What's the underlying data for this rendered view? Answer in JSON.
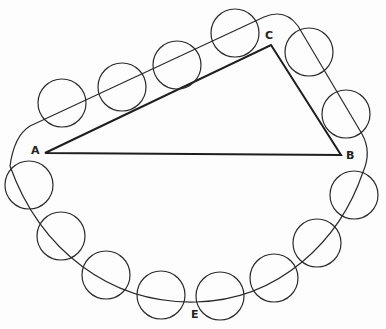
{
  "figure": {
    "stroke_color": "#2a2a2a",
    "background": "#fdfdfd"
  },
  "labels": {
    "A": "A",
    "B": "B",
    "C": "C",
    "E": "E"
  },
  "triangle": {
    "A": [
      45,
      153
    ],
    "B": [
      341,
      155
    ],
    "C": [
      271,
      45
    ]
  },
  "circles": [
    {
      "cx": 62,
      "cy": 103,
      "r": 24
    },
    {
      "cx": 122,
      "cy": 87,
      "r": 24
    },
    {
      "cx": 177,
      "cy": 65,
      "r": 24
    },
    {
      "cx": 235,
      "cy": 33,
      "r": 24
    },
    {
      "cx": 309,
      "cy": 52,
      "r": 24
    },
    {
      "cx": 346,
      "cy": 114,
      "r": 24
    },
    {
      "cx": 29,
      "cy": 185,
      "r": 24
    },
    {
      "cx": 61,
      "cy": 236,
      "r": 24
    },
    {
      "cx": 106,
      "cy": 275,
      "r": 24
    },
    {
      "cx": 161,
      "cy": 295,
      "r": 24
    },
    {
      "cx": 220,
      "cy": 296,
      "r": 24
    },
    {
      "cx": 274,
      "cy": 278,
      "r": 24
    },
    {
      "cx": 317,
      "cy": 243,
      "r": 24
    },
    {
      "cx": 354,
      "cy": 195,
      "r": 24
    }
  ]
}
